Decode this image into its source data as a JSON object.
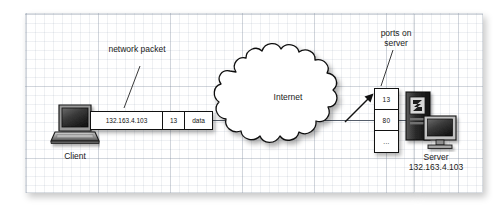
{
  "diagram": {
    "labels": {
      "network_packet": "network packet",
      "ports_on_server": "ports on server",
      "internet": "Internet",
      "client": "Client",
      "server": "Server",
      "server_ip": "132.163.4.103"
    },
    "packet": {
      "name": "network-packet",
      "fields": [
        {
          "key": "destination-ip",
          "value": "132.163.4.103"
        },
        {
          "key": "destination-port",
          "value": "13"
        },
        {
          "key": "payload",
          "value": "data"
        }
      ]
    },
    "ports": {
      "name": "ports-on-server",
      "entries": [
        {
          "key": "port-13",
          "value": "13"
        },
        {
          "key": "port-80",
          "value": "80"
        },
        {
          "key": "port-more",
          "value": "..."
        }
      ]
    },
    "icons": {
      "client": "laptop-computer-icon",
      "server": "server-tower-and-monitor-icon",
      "cloud": "internet-cloud-icon",
      "arrow": "arrow-to-port-icon"
    },
    "colors": {
      "stroke": "#111111",
      "text": "#1a1a1a",
      "paper": "#ffffff",
      "grid_major": "#8c96a5",
      "grid_minor": "#a0aab9",
      "device_dark": "#2b2b2b",
      "device_mid": "#7a7a7a",
      "device_light": "#c8c8c8"
    }
  }
}
